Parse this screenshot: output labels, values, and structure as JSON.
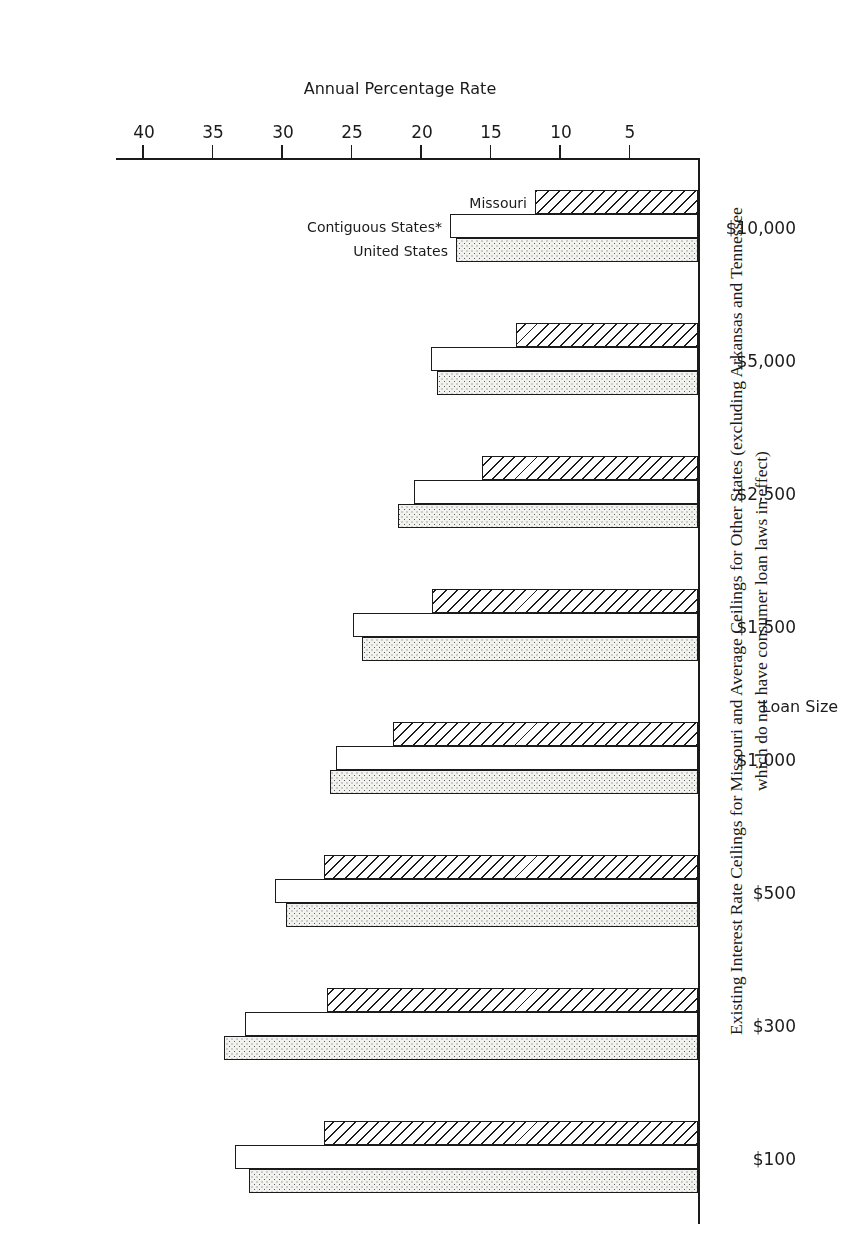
{
  "figure": {
    "title_line_1": "Existing Interest Rate Ceilings for Missouri and Average Ceilings for Other States (excluding Arkansas and Tennessee",
    "title_line_2": "which do not have consumer loan laws in effect)"
  },
  "axes": {
    "value_axis_title": "Annual Percentage Rate",
    "category_axis_title": "Loan Size",
    "value_ticks": [
      "5",
      "10",
      "15",
      "20",
      "25",
      "30",
      "35",
      "40"
    ]
  },
  "series_labels": {
    "missouri": "Missouri",
    "contiguous": "Contiguous States*",
    "united": "United States"
  },
  "chart_data": {
    "type": "bar",
    "orientation": "horizontal",
    "title": "Existing Interest Rate Ceilings for Missouri and Average Ceilings for Other States (excluding Arkansas and Tennessee which do not have consumer loan laws in effect)",
    "xlabel": "Loan Size",
    "ylabel": "Annual Percentage Rate",
    "ylim": [
      0,
      42
    ],
    "grid": false,
    "legend_position": "in-plot, last group",
    "categories": [
      "$100",
      "$300",
      "$500",
      "$1,000",
      "$1,500",
      "$2,500",
      "$5,000",
      "$10,000"
    ],
    "series": [
      {
        "name": "Missouri",
        "values": [
          26.9,
          26.7,
          26.9,
          21.9,
          19.1,
          15.5,
          13.1,
          11.7
        ]
      },
      {
        "name": "Contiguous States*",
        "values": [
          33.3,
          32.6,
          30.4,
          26.0,
          24.8,
          20.4,
          19.2,
          17.8
        ]
      },
      {
        "name": "United States",
        "values": [
          32.3,
          34.1,
          29.6,
          26.5,
          24.2,
          21.6,
          18.8,
          17.4
        ]
      }
    ]
  }
}
